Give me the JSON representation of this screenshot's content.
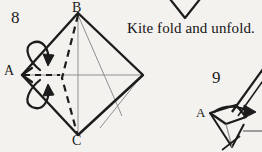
{
  "page": {
    "background_color": "#f4f2ef",
    "ink_color": "#1a1a1a",
    "crease_color": "#8a8a8a",
    "width": 262,
    "height": 152
  },
  "caption": {
    "text": "Kite fold and unfold."
  },
  "steps": [
    {
      "number": "8",
      "shape": "diamond",
      "vertices": {
        "top": "B",
        "left": "A",
        "bottom": "C"
      },
      "arrows": "fold-and-unfold-double-curved-arrow",
      "creases": "kite-fold-crease-lines"
    },
    {
      "number": "9",
      "shape": "folded-kite-partial",
      "vertices": {
        "left": "A"
      },
      "arrows": "fold-arrow-right"
    }
  ],
  "labels": {
    "step_8": "8",
    "step_9": "9",
    "vertex_b": "B",
    "vertex_c": "C",
    "vertex_a": "A",
    "vertex_a_step9": "A"
  },
  "icons": {
    "chevron_above_caption": "v-chevron-shape",
    "fold_arrow_upper": "curved-fold-arrow-icon",
    "fold_arrow_lower": "curved-unfold-arrow-icon",
    "fold_arrow_step9": "straight-fold-arrow-icon"
  }
}
